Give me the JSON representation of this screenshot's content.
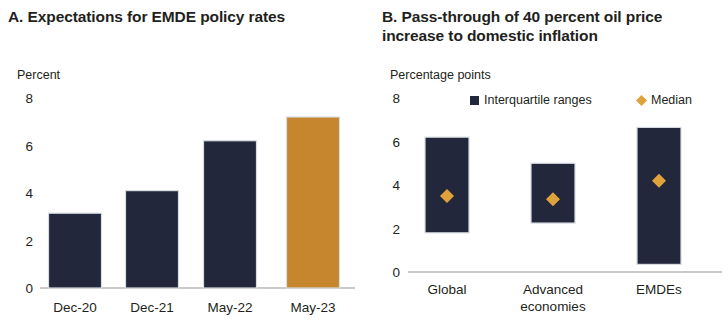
{
  "panels": [
    {
      "id": "A",
      "title": "A. Expectations for EMDE policy rates",
      "unit": "Percent",
      "chart_data": {
        "type": "bar",
        "title": "A. Expectations for EMDE policy rates",
        "xlabel": "",
        "ylabel": "Percent",
        "ylim": [
          0,
          8
        ],
        "yticks": [
          0,
          2,
          4,
          6,
          8
        ],
        "ytick_labels": [
          "0",
          "2",
          "4",
          "6",
          "8"
        ],
        "grid": false,
        "legend": "none",
        "categories": [
          "Dec-20",
          "Dec-21",
          "May-22",
          "May-23"
        ],
        "values": [
          3.15,
          4.1,
          6.2,
          7.2
        ],
        "colors": [
          "#23273c",
          "#23273c",
          "#23273c",
          "#c5862e"
        ]
      }
    },
    {
      "id": "B",
      "title": "B. Pass-through of 40 percent oil price increase to domestic inflation",
      "unit": "Percentage points",
      "legend": [
        {
          "label": "Interquartile ranges",
          "marker": "square",
          "color": "#23273c"
        },
        {
          "label": "Median",
          "marker": "diamond",
          "color": "#e0a33c"
        }
      ],
      "chart_data": {
        "type": "bar",
        "title": "B. Pass-through of 40 percent oil price increase to domestic inflation",
        "xlabel": "",
        "ylabel": "Percentage points",
        "ylim": [
          0,
          8
        ],
        "yticks": [
          0,
          2,
          4,
          6,
          8
        ],
        "ytick_labels": [
          "0",
          "2",
          "4",
          "6",
          "8"
        ],
        "grid": false,
        "legend": "top",
        "legend_entries": [
          "Interquartile ranges",
          "Median"
        ],
        "categories": [
          "Global",
          "Advanced economies",
          "EMDEs"
        ],
        "series": [
          {
            "name": "Interquartile ranges",
            "type": "range",
            "low": [
              1.8,
              2.25,
              0.35
            ],
            "high": [
              6.2,
              5.0,
              6.65
            ],
            "color": "#23273c"
          },
          {
            "name": "Median",
            "type": "marker",
            "values": [
              3.5,
              3.35,
              4.2
            ],
            "color": "#e0a33c"
          }
        ]
      }
    }
  ],
  "colors": {
    "dark": "#23273c",
    "orange": "#c5862e",
    "median_orange": "#e0a33c",
    "axis": "#b9b9b9",
    "text": "#231f20"
  }
}
